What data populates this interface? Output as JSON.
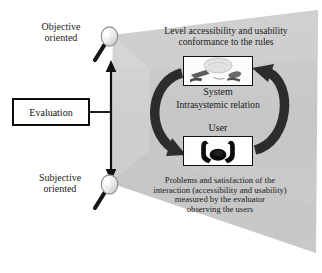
{
  "diagram": {
    "colors": {
      "wedge_fill": "#c9c9c9",
      "wedge_fill_light": "#d7d7d7",
      "stroke": "#111111",
      "loop_arrow": "#2b2b2b",
      "text": "#1a1a1a",
      "background": "#ffffff"
    }
  },
  "labels": {
    "objective_oriented": "Objective\noriented",
    "subjective_oriented": "Subjective\noriented",
    "evaluation": "Evaluation",
    "system": "System",
    "intrasystemic_relation": "Intrasystemic relation",
    "user": "User"
  },
  "texts": {
    "top_block": "Level accessibility and usability\nconformance to the rules",
    "bottom_block": "Problems and satisfaction of the\ninteraction (accessibility and usability)\nmeasured by the evaluator\nobserving the users"
  },
  "icons": {
    "magnifier_top": "magnifying-glass-icon",
    "magnifier_bottom": "magnifying-glass-icon",
    "system_picture": "computer-keyboard-icon",
    "user_picture": "person-silhouette-icon",
    "vertical_arrow": "double-headed-vertical-arrow-icon",
    "cycle_arrow": "circular-double-arrow-icon"
  }
}
